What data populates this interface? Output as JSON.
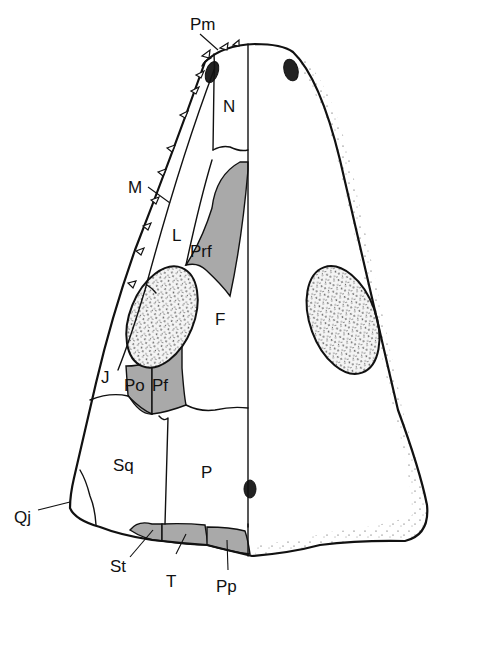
{
  "figure": {
    "type": "anatomical-line-drawing",
    "colors": {
      "line": "#111111",
      "shaded_bones": "#a9a9a9",
      "background": "#ffffff",
      "stipple": "#222222"
    }
  },
  "labels": {
    "pm": "Pm",
    "n": "N",
    "m": "M",
    "l": "L",
    "prf": "Prf",
    "f": "F",
    "j": "J",
    "po": "Po",
    "pf": "Pf",
    "sq": "Sq",
    "p": "P",
    "qj": "Qj",
    "st": "St",
    "t": "T",
    "pp": "Pp"
  }
}
